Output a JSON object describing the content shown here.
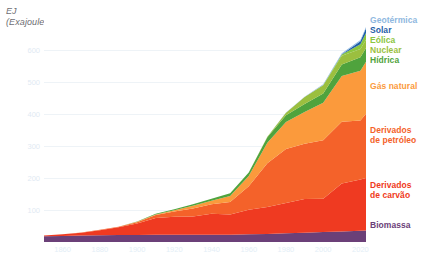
{
  "axis_title": "EJ\n(Exajoules)",
  "chart_data": {
    "type": "area",
    "stacked": true,
    "title": "",
    "subtitle": "",
    "xlabel": "",
    "ylabel": "EJ (Exajoules)",
    "xlim": [
      1850,
      2023
    ],
    "ylim": [
      0,
      700
    ],
    "grid": true,
    "legend_position": "right",
    "xticks": [
      "1860",
      "1880",
      "1900",
      "1920",
      "1940",
      "1960",
      "1980",
      "2000",
      "2020"
    ],
    "xtick_values": [
      1860,
      1880,
      1900,
      1920,
      1940,
      1960,
      1980,
      2000,
      2020
    ],
    "yticks": [
      "100",
      "200",
      "300",
      "400",
      "500",
      "600"
    ],
    "ytick_values": [
      100,
      200,
      300,
      400,
      500,
      600
    ],
    "x": [
      1850,
      1860,
      1870,
      1880,
      1890,
      1900,
      1910,
      1920,
      1930,
      1940,
      1950,
      1960,
      1970,
      1980,
      1990,
      2000,
      2010,
      2020,
      2023
    ],
    "series": [
      {
        "name": "Biomassa",
        "color": "#6b4078",
        "values": [
          18,
          19,
          20,
          21,
          22,
          22,
          23,
          23,
          23,
          23,
          23,
          24,
          25,
          27,
          29,
          31,
          33,
          35,
          36
        ]
      },
      {
        "name": "Derivados de carvão",
        "color": "#ef3a21",
        "values": [
          2,
          5,
          9,
          16,
          24,
          36,
          52,
          56,
          57,
          65,
          63,
          77,
          84,
          95,
          105,
          104,
          150,
          160,
          164
        ]
      },
      {
        "name": "Derivados de petróleo",
        "color": "#f4622a",
        "values": [
          0,
          0,
          1,
          1,
          2,
          4,
          9,
          16,
          25,
          30,
          39,
          73,
          137,
          169,
          173,
          183,
          193,
          185,
          201
        ]
      },
      {
        "name": "Gás natural",
        "color": "#fb9a3c",
        "values": [
          0,
          0,
          0,
          0,
          0,
          1,
          2,
          4,
          8,
          11,
          19,
          32,
          64,
          84,
          99,
          117,
          143,
          155,
          162
        ]
      },
      {
        "name": "Hídrica",
        "color": "#4fa33d",
        "values": [
          0,
          0,
          0,
          0,
          0,
          1,
          2,
          3,
          5,
          6,
          8,
          11,
          17,
          21,
          25,
          29,
          36,
          42,
          43
        ]
      },
      {
        "name": "Nuclear",
        "color": "#9bbf3f",
        "values": [
          0,
          0,
          0,
          0,
          0,
          0,
          0,
          0,
          0,
          0,
          0,
          0,
          2,
          8,
          22,
          26,
          27,
          26,
          26
        ]
      },
      {
        "name": "Eólica",
        "color": "#8cc63f",
        "values": [
          0,
          0,
          0,
          0,
          0,
          0,
          0,
          0,
          0,
          0,
          0,
          0,
          0,
          0,
          0,
          1,
          4,
          15,
          21
        ]
      },
      {
        "name": "Solar",
        "color": "#1f5fa8",
        "values": [
          0,
          0,
          0,
          0,
          0,
          0,
          0,
          0,
          0,
          0,
          0,
          0,
          0,
          0,
          0,
          0,
          1,
          9,
          15
        ]
      },
      {
        "name": "Geotérmica",
        "color": "#8fb8e0",
        "values": [
          0,
          0,
          0,
          0,
          0,
          0,
          0,
          0,
          0,
          0,
          0,
          0,
          0,
          1,
          1,
          2,
          3,
          4,
          4
        ]
      }
    ]
  },
  "legend": [
    {
      "label": "Geotérmica",
      "color": "#8fb8e0",
      "top": 16
    },
    {
      "label": "Solar",
      "color": "#1f5fa8",
      "top": 26
    },
    {
      "label": "Eólica",
      "color": "#8cc63f",
      "top": 36
    },
    {
      "label": "Nuclear",
      "color": "#9bbf3f",
      "top": 46
    },
    {
      "label": "Hídrica",
      "color": "#4fa33d",
      "top": 56
    },
    {
      "label": "Gás natural",
      "color": "#fb9a3c",
      "top": 82
    },
    {
      "label": "Derivados\nde petróleo",
      "color": "#f4622a",
      "top": 126
    },
    {
      "label": "Derivados\nde carvão",
      "color": "#ef3a21",
      "top": 181
    },
    {
      "label": "Biomassa",
      "color": "#6b4078",
      "top": 221
    }
  ]
}
